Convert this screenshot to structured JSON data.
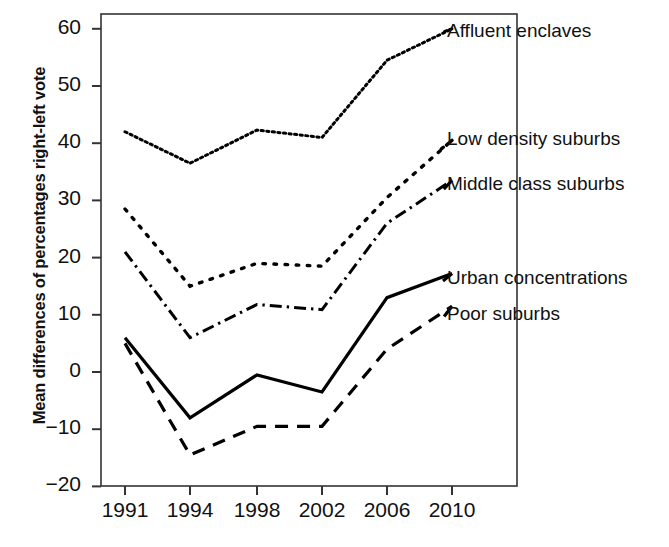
{
  "chart_data": {
    "type": "line",
    "title": "",
    "subtitle": "",
    "xlabel": "",
    "ylabel": "Mean differences of percentages right-left vote",
    "categories": [
      "1991",
      "1994",
      "1998",
      "2002",
      "2006",
      "2010"
    ],
    "x_ticks": [
      "1991",
      "1994",
      "1998",
      "2002",
      "2006",
      "2010"
    ],
    "y_ticks": [
      60,
      50,
      40,
      30,
      20,
      10,
      0,
      -10,
      -20
    ],
    "y_tick_labels": [
      "60",
      "50",
      "40",
      "30",
      "20",
      "10",
      "0",
      "−10",
      "−20"
    ],
    "ylim": [
      -20,
      63
    ],
    "grid": false,
    "legend_position": "right-inline",
    "series": [
      {
        "name": "Affluent enclaves",
        "style": "fine-dotted",
        "values": [
          42.0,
          36.5,
          42.3,
          41.0,
          54.5,
          60.0
        ]
      },
      {
        "name": "Low density suburbs",
        "style": "coarse-dotted",
        "values": [
          28.5,
          15.0,
          19.0,
          18.5,
          30.5,
          40.5
        ]
      },
      {
        "name": "Middle class suburbs",
        "style": "dash-dot",
        "values": [
          21.0,
          6.0,
          11.8,
          10.9,
          26.0,
          33.5
        ]
      },
      {
        "name": "Urban concentrations",
        "style": "solid",
        "values": [
          6.0,
          -8.0,
          -0.5,
          -3.5,
          13.0,
          17.2
        ]
      },
      {
        "name": "Poor suburbs",
        "style": "long-dashed",
        "values": [
          5.0,
          -14.5,
          -9.5,
          -9.5,
          4.0,
          11.5
        ]
      }
    ]
  },
  "axis": {
    "y_title": "Mean differences of percentages right-left vote"
  },
  "labels": {
    "affluent_enclaves": "Affluent enclaves",
    "low_density_suburbs": "Low density suburbs",
    "middle_class_suburbs": "Middle class suburbs",
    "urban_concentrations": "Urban concentrations",
    "poor_suburbs": "Poor suburbs"
  },
  "colors": {
    "line": "#000000",
    "axis": "#333333",
    "background": "#ffffff"
  }
}
